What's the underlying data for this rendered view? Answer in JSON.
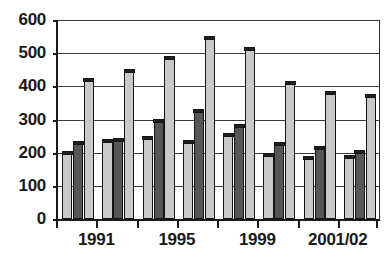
{
  "chart_data": {
    "type": "bar",
    "title": "",
    "subtitle": "",
    "xlabel": "",
    "ylabel": "",
    "ylim": [
      0,
      600
    ],
    "yticks": [
      0,
      100,
      200,
      300,
      400,
      500,
      600
    ],
    "ytick_labels": [
      "0",
      "100",
      "200",
      "300",
      "400",
      "500",
      "600"
    ],
    "grid": true,
    "legend": "none",
    "categories": [
      "1991",
      "",
      "1995",
      "",
      "1999",
      "",
      "2001/02",
      ""
    ],
    "xtick_labels": [
      "1991",
      "1995",
      "1999",
      "2001/02"
    ],
    "xtick_group_index": [
      0,
      2,
      4,
      6
    ],
    "series": [
      {
        "name": "series-1",
        "color": "#c9c9c9",
        "values": [
          205,
          240,
          250,
          237,
          257,
          198,
          190,
          192
        ]
      },
      {
        "name": "series-2",
        "color": "#565656",
        "values": [
          235,
          243,
          300,
          330,
          285,
          232,
          220,
          207
        ]
      },
      {
        "name": "series-3",
        "color": "#c9c9c9",
        "values": [
          425,
          452,
          490,
          550,
          518,
          415,
          385,
          375
        ]
      }
    ]
  },
  "axis": {
    "line_color": "#1a1a1a",
    "grid_color": "#3a3a3a"
  }
}
